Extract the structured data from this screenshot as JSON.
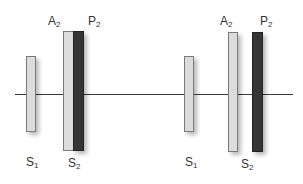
{
  "diagram": {
    "axis": {
      "y": 94,
      "x1": 15,
      "x2": 293
    },
    "groups": [
      {
        "name": "left",
        "bars": [
          {
            "id": "S1",
            "x": 26,
            "y": 56,
            "w": 10,
            "h": 76,
            "style": "light"
          },
          {
            "id": "A2",
            "x": 63,
            "y": 31,
            "w": 11,
            "h": 120,
            "style": "light"
          },
          {
            "id": "P2",
            "x": 73,
            "y": 31,
            "w": 11,
            "h": 120,
            "style": "dark"
          }
        ],
        "labels": [
          {
            "base": "A",
            "sub": "2",
            "x": 48,
            "y": 15
          },
          {
            "base": "P",
            "sub": "2",
            "x": 88,
            "y": 15
          },
          {
            "base": "S",
            "sub": "1",
            "x": 26,
            "y": 156
          },
          {
            "base": "S",
            "sub": "2",
            "x": 68,
            "y": 157
          }
        ]
      },
      {
        "name": "right",
        "bars": [
          {
            "id": "S1",
            "x": 184,
            "y": 56,
            "w": 10,
            "h": 76,
            "style": "light"
          },
          {
            "id": "A2",
            "x": 228,
            "y": 32,
            "w": 10,
            "h": 120,
            "style": "light"
          },
          {
            "id": "P2",
            "x": 252,
            "y": 32,
            "w": 11,
            "h": 120,
            "style": "dark"
          }
        ],
        "labels": [
          {
            "base": "A",
            "sub": "2",
            "x": 220,
            "y": 15
          },
          {
            "base": "P",
            "sub": "2",
            "x": 260,
            "y": 15
          },
          {
            "base": "S",
            "sub": "1",
            "x": 185,
            "y": 156
          },
          {
            "base": "S",
            "sub": "2",
            "x": 241,
            "y": 158
          }
        ]
      }
    ]
  },
  "text": {
    "left": {
      "A2": {
        "base": "A",
        "sub": "2"
      },
      "P2": {
        "base": "P",
        "sub": "2"
      },
      "S1": {
        "base": "S",
        "sub": "1"
      },
      "S2": {
        "base": "S",
        "sub": "2"
      }
    },
    "right": {
      "A2": {
        "base": "A",
        "sub": "2"
      },
      "P2": {
        "base": "P",
        "sub": "2"
      },
      "S1": {
        "base": "S",
        "sub": "1"
      },
      "S2": {
        "base": "S",
        "sub": "2"
      }
    }
  }
}
